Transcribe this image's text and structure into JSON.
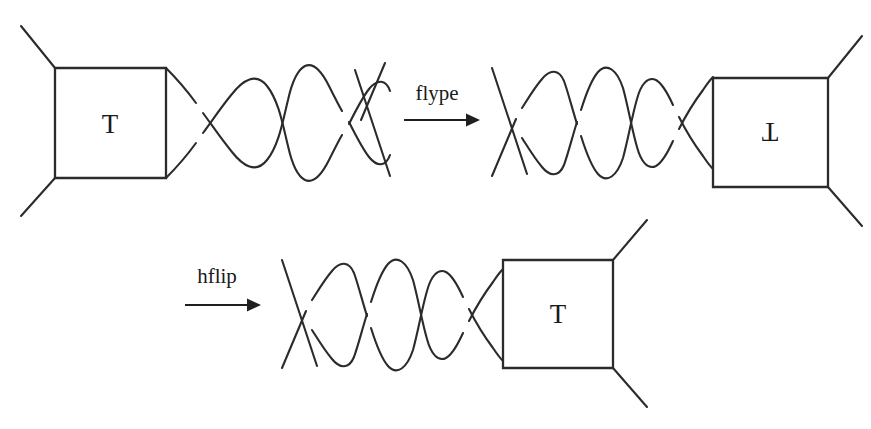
{
  "figure": {
    "type": "knot-theory-tangle-diagram",
    "background_color": "#ffffff",
    "stroke_color": "#2b2b2b",
    "width": 871,
    "height": 429
  },
  "diagrams": [
    {
      "id": "top-left",
      "name": "tangle-with-trailing-twists",
      "box_label": "T",
      "box_label_orientation": "upright",
      "twist_crossings": 3,
      "box_side": "left"
    },
    {
      "id": "top-right",
      "name": "flyped-tangle",
      "box_label": "T",
      "box_label_orientation": "vertically-flipped",
      "twist_crossings": 3,
      "box_side": "right"
    },
    {
      "id": "bottom",
      "name": "hflipped-tangle",
      "box_label": "T",
      "box_label_orientation": "upright",
      "twist_crossings": 3,
      "box_side": "right"
    }
  ],
  "operations": [
    {
      "id": "flype",
      "label": "flype",
      "arrow": "rightwards-arrow",
      "label_x": 437,
      "label_y": 100,
      "arrow_y": 120,
      "arrow_x1": 404,
      "arrow_x2": 472
    },
    {
      "id": "hflip",
      "label": "hflip",
      "arrow": "rightwards-arrow",
      "label_x": 217,
      "label_y": 283,
      "arrow_y": 305,
      "arrow_x1": 185,
      "arrow_x2": 253
    }
  ]
}
